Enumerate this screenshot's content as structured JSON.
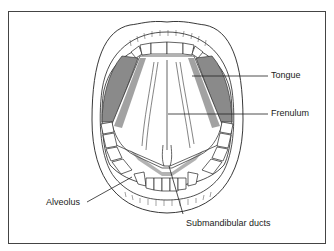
{
  "figure": {
    "labels": {
      "tongue": "Tongue",
      "frenulum": "Frenulum",
      "alveolus": "Alveolus",
      "submandibular_ducts": "Submandibular ducts"
    },
    "colors": {
      "line": "#222222",
      "shade": "#8a8a8a",
      "stipple": "#555555",
      "frame": "#444444"
    }
  }
}
